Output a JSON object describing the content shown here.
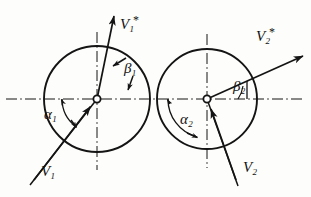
{
  "figure": {
    "stroke_color": "#141414",
    "background_color": "#fdfdfb",
    "circles": [
      {
        "name": "left-circle",
        "cx": 97,
        "cy": 99,
        "r": 53
      },
      {
        "name": "right-circle",
        "cx": 207,
        "cy": 99,
        "r": 50
      }
    ],
    "centerlines": {
      "horizontal_y": 99,
      "vertical_x_left": 97,
      "vertical_x_right": 207,
      "style": "dash-dot"
    }
  },
  "labels": {
    "v1_star": {
      "base": "V",
      "sub": "1",
      "star": "*",
      "x": 120,
      "y": 14
    },
    "v2_star": {
      "base": "V",
      "sub": "2",
      "star": "*",
      "x": 256,
      "y": 26
    },
    "v1": {
      "base": "V",
      "sub": "1",
      "x": 41,
      "y": 164
    },
    "v2": {
      "base": "V",
      "sub": "2",
      "x": 243,
      "y": 160
    },
    "beta1": {
      "base": "β",
      "sub": "1",
      "x": 124,
      "y": 61
    },
    "beta2": {
      "base": "β",
      "sub": "2",
      "x": 233,
      "y": 79
    },
    "alpha1": {
      "base": "α",
      "sub": "1",
      "x": 44,
      "y": 107
    },
    "alpha2": {
      "base": "α",
      "sub": "2",
      "x": 180,
      "y": 112
    }
  },
  "vectors": [
    {
      "name": "v1-incoming-vector",
      "label": "V1",
      "from": {
        "x": 34,
        "y": 180
      },
      "to": {
        "x": 97,
        "y": 99
      },
      "arrow_at": "head-near-center",
      "description": "incoming velocity into left circle center from lower-left"
    },
    {
      "name": "v1-star-outgoing-vector",
      "label": "V1*",
      "from": {
        "x": 97,
        "y": 99
      },
      "to": {
        "x": 113,
        "y": 13
      },
      "arrow_at": "head",
      "description": "outgoing velocity from left circle center toward upper right, steep"
    },
    {
      "name": "v2-incoming-vector",
      "label": "V2",
      "from": {
        "x": 236,
        "y": 180
      },
      "to": {
        "x": 207,
        "y": 99
      },
      "arrow_at": "head-near-center",
      "description": "incoming velocity into right circle center from lower-right-of-left, steep"
    },
    {
      "name": "v2-star-outgoing-vector",
      "label": "V2*",
      "from": {
        "x": 207,
        "y": 99
      },
      "to": {
        "x": 302,
        "y": 57
      },
      "arrow_at": "head",
      "description": "outgoing velocity from right circle center toward upper right, shallow"
    }
  ],
  "angles": [
    {
      "name": "alpha1-angle-arc",
      "label": "α1",
      "vertex": {
        "x": 97,
        "y": 99
      },
      "from_direction": "left-horizontal",
      "to_direction": "v1-incoming",
      "sweep_degrees": 52,
      "size": "small"
    },
    {
      "name": "alpha2-angle-arc",
      "label": "α2",
      "vertex": {
        "x": 207,
        "y": 99
      },
      "from_direction": "left-horizontal",
      "to_direction": "v2-incoming",
      "sweep_degrees": 110,
      "size": "large"
    },
    {
      "name": "beta1-angle-arc",
      "label": "β1",
      "vertex": {
        "x": 97,
        "y": 99
      },
      "from_direction": "up-vertical",
      "to_direction": "v1-star-outgoing",
      "sweep_degrees": 11,
      "size": "small"
    },
    {
      "name": "beta2-angle-arc",
      "label": "β2",
      "vertex": {
        "x": 207,
        "y": 99
      },
      "from_direction": "right-horizontal",
      "to_direction": "v2-star-outgoing",
      "sweep_degrees": 24,
      "size": "small"
    }
  ]
}
